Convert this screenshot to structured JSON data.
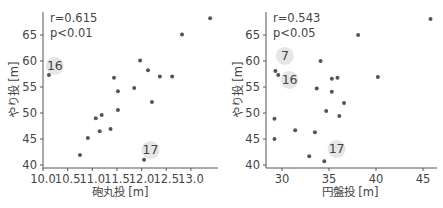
{
  "chart_data": [
    {
      "type": "scatter",
      "title": "",
      "xlabel": "砲丸投 [m]",
      "ylabel": "やり投 [m]",
      "xlim": [
        10.0,
        13.45
      ],
      "ylim": [
        39.8,
        69.0
      ],
      "xticks": [
        10.0,
        10.5,
        11.0,
        11.5,
        12.0,
        12.5,
        13.0
      ],
      "xtick_labels": [
        "10.0",
        "10.5",
        "11.0",
        "11.5",
        "12.0",
        "12.5",
        "13.0"
      ],
      "yticks": [
        40,
        45,
        50,
        55,
        60,
        65
      ],
      "ytick_labels": [
        "40",
        "45",
        "50",
        "55",
        "60",
        "65"
      ],
      "grid": false,
      "stats": {
        "r": "r=0.615",
        "p": "p<0.01"
      },
      "points": [
        {
          "x": 10.12,
          "y": 57.3,
          "label": "16"
        },
        {
          "x": 10.75,
          "y": 41.9
        },
        {
          "x": 10.91,
          "y": 45.2
        },
        {
          "x": 11.07,
          "y": 49.0
        },
        {
          "x": 11.19,
          "y": 49.6
        },
        {
          "x": 11.15,
          "y": 46.5
        },
        {
          "x": 11.37,
          "y": 46.9
        },
        {
          "x": 11.44,
          "y": 56.8
        },
        {
          "x": 11.52,
          "y": 54.2
        },
        {
          "x": 11.52,
          "y": 50.6
        },
        {
          "x": 11.85,
          "y": 54.8
        },
        {
          "x": 11.97,
          "y": 60.1
        },
        {
          "x": 12.13,
          "y": 58.2
        },
        {
          "x": 12.21,
          "y": 52.1
        },
        {
          "x": 12.37,
          "y": 57.0
        },
        {
          "x": 12.62,
          "y": 57.0
        },
        {
          "x": 12.82,
          "y": 65.1
        },
        {
          "x": 13.39,
          "y": 68.2
        },
        {
          "x": 12.05,
          "y": 41.0,
          "label": "17"
        }
      ],
      "annotations": [
        {
          "text": "16",
          "x": 10.22,
          "y": 58.3
        },
        {
          "text": "17",
          "x": 12.16,
          "y": 42.1
        }
      ]
    },
    {
      "type": "scatter",
      "title": "",
      "xlabel": "円盤投 [m]",
      "ylabel": "やり投 [m]",
      "xlim": [
        28.3,
        46.3
      ],
      "ylim": [
        39.8,
        69.0
      ],
      "xticks": [
        30,
        35,
        40,
        45
      ],
      "xtick_labels": [
        "30",
        "35",
        "40",
        "45"
      ],
      "yticks": [
        40,
        45,
        50,
        55,
        60,
        65
      ],
      "ytick_labels": [
        "40",
        "45",
        "50",
        "55",
        "60",
        "65"
      ],
      "grid": false,
      "stats": {
        "r": "r=0.543",
        "p": "p<0.05"
      },
      "points": [
        {
          "x": 29.3,
          "y": 58.1,
          "label": "7"
        },
        {
          "x": 29.6,
          "y": 57.3,
          "label": "16"
        },
        {
          "x": 29.2,
          "y": 48.9
        },
        {
          "x": 29.2,
          "y": 45.0
        },
        {
          "x": 31.4,
          "y": 46.7
        },
        {
          "x": 33.5,
          "y": 46.3
        },
        {
          "x": 32.9,
          "y": 41.7
        },
        {
          "x": 34.5,
          "y": 40.7,
          "label": "17"
        },
        {
          "x": 33.7,
          "y": 54.7
        },
        {
          "x": 34.1,
          "y": 60.0
        },
        {
          "x": 35.3,
          "y": 56.6
        },
        {
          "x": 35.9,
          "y": 56.8
        },
        {
          "x": 35.3,
          "y": 54.1
        },
        {
          "x": 34.7,
          "y": 50.4
        },
        {
          "x": 36.6,
          "y": 51.9
        },
        {
          "x": 36.1,
          "y": 49.4
        },
        {
          "x": 38.1,
          "y": 65.0
        },
        {
          "x": 40.2,
          "y": 56.9
        },
        {
          "x": 45.8,
          "y": 68.1
        }
      ],
      "annotations": [
        {
          "text": "7",
          "x": 30.2,
          "y": 60.2
        },
        {
          "text": "16",
          "x": 30.7,
          "y": 55.6
        },
        {
          "text": "17",
          "x": 35.7,
          "y": 42.3
        }
      ]
    }
  ]
}
